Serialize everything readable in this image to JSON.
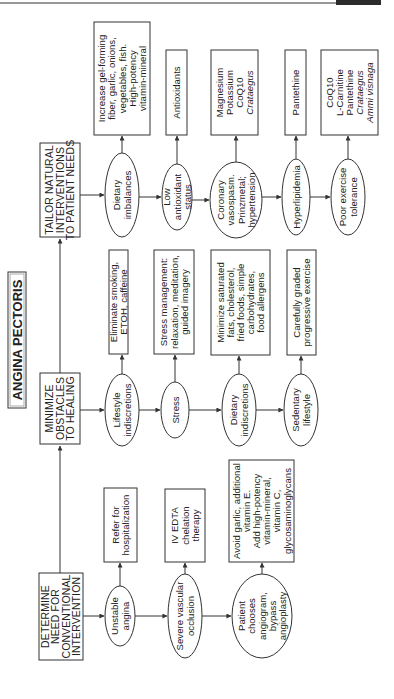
{
  "title": "ANGINA PECTORIS",
  "columns": [
    {
      "id": "tailor",
      "header": [
        "TAILOR NATURAL",
        "INTERVENTIONS",
        "TO PATIENT NEEDS"
      ],
      "conditions": [
        {
          "label": [
            "Dietary",
            "imbalances"
          ],
          "intervention": [
            "Increase gel-forming",
            "fiber, garlic, onions,",
            "vegetables, fish.",
            "High-potency",
            "vitamin-mineral"
          ],
          "italic_lines": []
        },
        {
          "label": [
            "Low",
            "antioxidant",
            "status"
          ],
          "intervention": [
            "Antioxidants"
          ],
          "italic_lines": []
        },
        {
          "label": [
            "Coronary",
            "vasospasm.",
            "Prinzmetal;",
            "hypertension"
          ],
          "intervention": [
            "Magnesium",
            "Potassium",
            "CoQ10",
            "Crataegus"
          ],
          "italic_lines": [
            3
          ]
        },
        {
          "label": [
            "Hyperlipidemia"
          ],
          "intervention": [
            "Pantethine"
          ],
          "italic_lines": []
        },
        {
          "label": [
            "Poor exercise",
            "tolerance"
          ],
          "intervention": [
            "CoQ10",
            "L-Carnitine",
            "Pantethine",
            "Crataegus",
            "Ammi visnaga"
          ],
          "italic_lines": [
            3,
            4
          ]
        }
      ]
    },
    {
      "id": "minimize",
      "header": [
        "MINIMIZE",
        "OBSTACLES",
        "TO HEALING"
      ],
      "conditions": [
        {
          "label": [
            "Lifestyle",
            "indiscretions"
          ],
          "intervention": [
            "Eliminate smoking,",
            "ETOH, caffeine"
          ],
          "italic_lines": []
        },
        {
          "label": [
            "Stress"
          ],
          "intervention": [
            "Stress management:",
            "relaxation, meditation,",
            "guided imagery"
          ],
          "italic_lines": []
        },
        {
          "label": [
            "Dietary",
            "indiscretions"
          ],
          "intervention": [
            "Minimize saturated",
            "fats, cholesterol,",
            "fried foods, simple",
            "carbohydrates,",
            "food allergens"
          ],
          "italic_lines": []
        },
        {
          "label": [
            "Sedentary",
            "lifestyle"
          ],
          "intervention": [
            "Carefully graded",
            "progressive exercise"
          ],
          "italic_lines": []
        }
      ]
    },
    {
      "id": "determine",
      "header": [
        "DETERMINE",
        "NEED FOR",
        "CONVENTIONAL",
        "INTERVENTION"
      ],
      "conditions": [
        {
          "label": [
            "Unstable",
            "angina"
          ],
          "intervention": [
            "Refer for",
            "hospitalization"
          ],
          "italic_lines": []
        },
        {
          "label": [
            "Severe vascular",
            "occlusion"
          ],
          "intervention": [
            "IV EDTA",
            "chelation",
            "therapy"
          ],
          "italic_lines": []
        },
        {
          "label": [
            "Patient",
            "chooses",
            "angiogram,",
            "bypass",
            "angioplasty"
          ],
          "intervention": [
            "Avoid garlic, additional",
            "vitamin E.",
            "Add high-potency",
            "vitamin-mineral,",
            "vitamin C,",
            "glycosaminoglycans"
          ],
          "italic_lines": []
        }
      ]
    }
  ],
  "colors": {
    "stroke": "#333333",
    "text": "#222222",
    "background": "#ffffff",
    "header_bar": "#2b2b2b"
  }
}
